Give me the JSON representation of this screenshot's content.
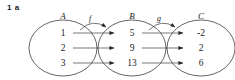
{
  "question": {
    "number": "1",
    "part": "a",
    "label": "1 a"
  },
  "diagram": {
    "type": "function-composition-mapping",
    "sets": [
      {
        "id": "A",
        "label": "A",
        "cx": 63,
        "cy": 48,
        "rx": 34,
        "ry": 28,
        "elements": [
          "1",
          "2",
          "3"
        ]
      },
      {
        "id": "B",
        "label": "B",
        "cx": 132,
        "cy": 48,
        "rx": 34,
        "ry": 28,
        "elements": [
          "5",
          "9",
          "13"
        ]
      },
      {
        "id": "C",
        "label": "C",
        "cx": 201,
        "cy": 48,
        "rx": 34,
        "ry": 28,
        "elements": [
          "-2",
          "2",
          "6"
        ]
      }
    ],
    "mappings": [
      {
        "name": "f",
        "label": "f",
        "from": "A",
        "to": "B",
        "pairs": [
          {
            "from": "1",
            "to": "5"
          },
          {
            "from": "2",
            "to": "9"
          },
          {
            "from": "3",
            "to": "13"
          }
        ]
      },
      {
        "name": "g",
        "label": "g",
        "from": "B",
        "to": "C",
        "pairs": [
          {
            "from": "5",
            "to": "-2"
          },
          {
            "from": "9",
            "to": "2"
          },
          {
            "from": "13",
            "to": "6"
          }
        ]
      }
    ],
    "colors": {
      "stroke": "#3c3c3c",
      "text": "#1a1a1a",
      "background": "#ffffff"
    },
    "rows": [
      {
        "y": 33
      },
      {
        "y": 48
      },
      {
        "y": 63
      }
    ]
  }
}
